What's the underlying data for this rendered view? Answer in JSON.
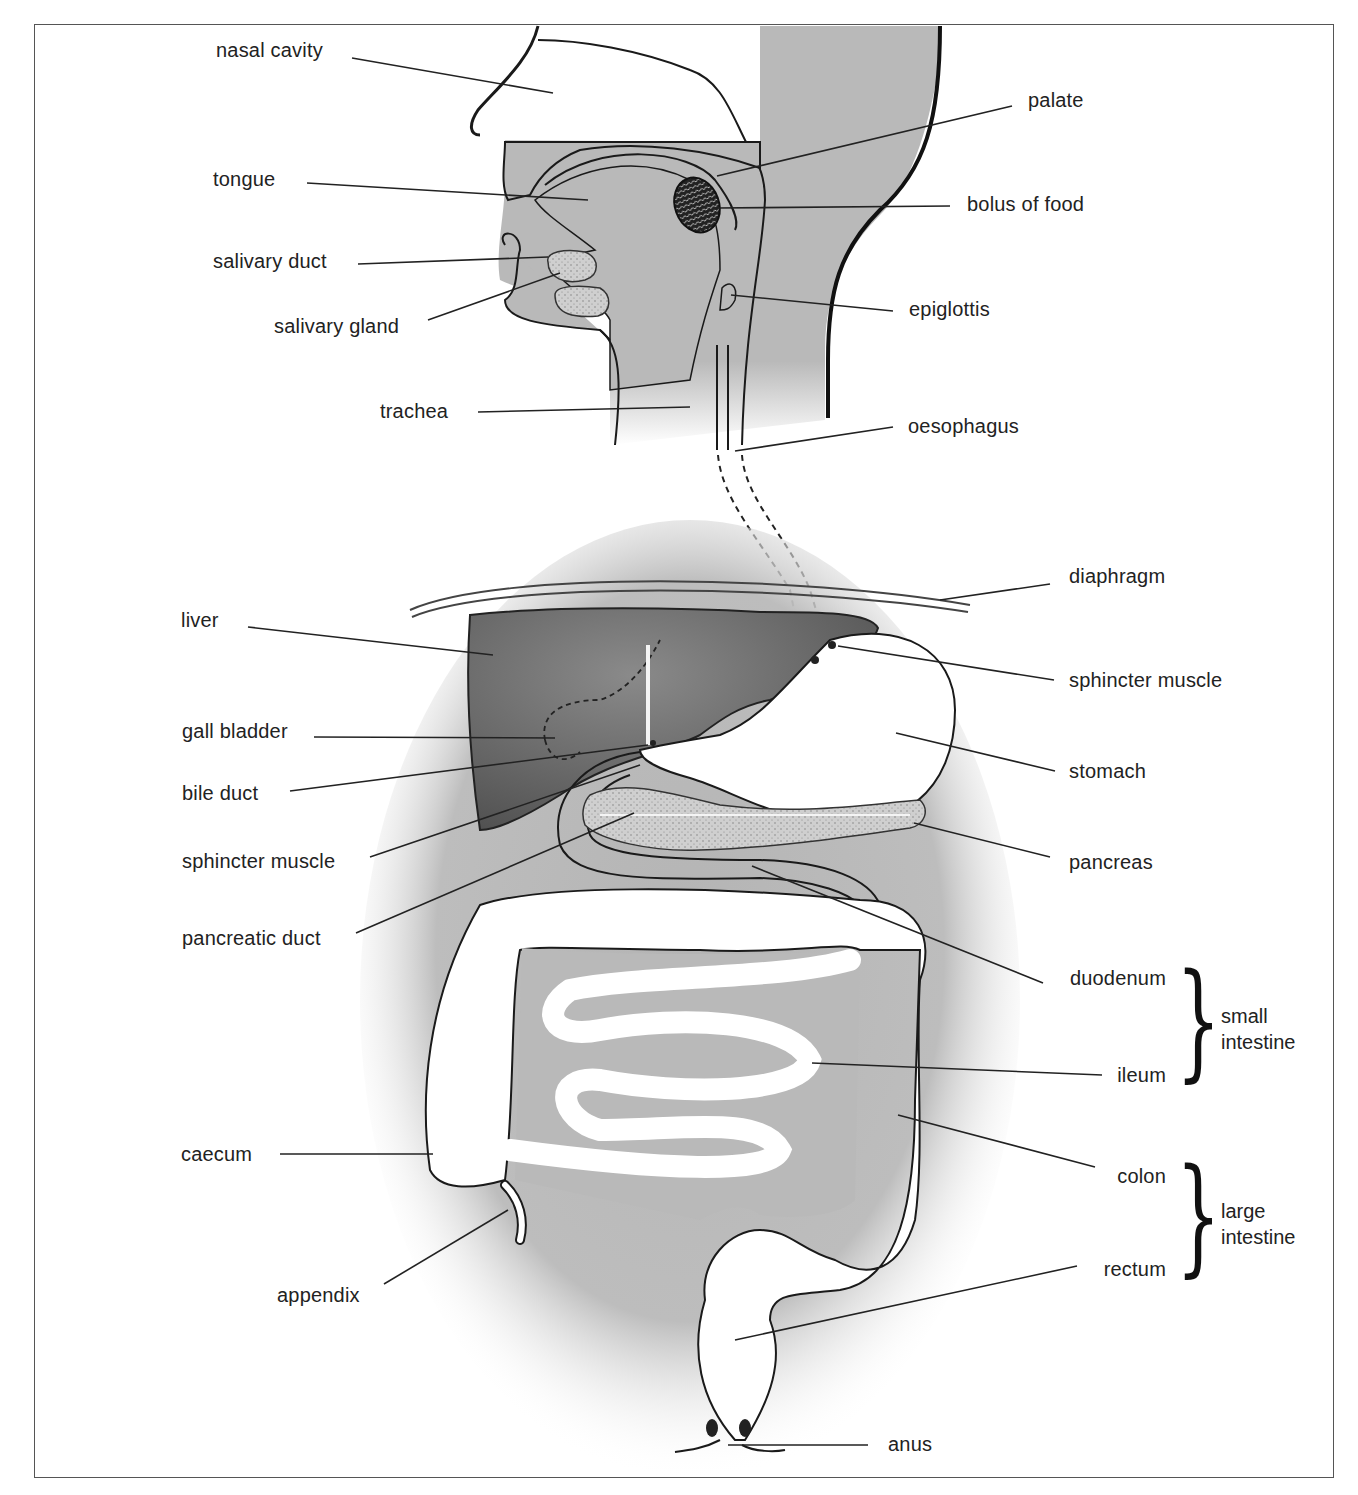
{
  "diagram": {
    "colors": {
      "tissue_gray": "#b9b9b9",
      "liver_dark": "#6f6f6f",
      "outline": "#1a1a1a",
      "background": "#ffffff"
    },
    "labels": {
      "nasal_cavity": "nasal cavity",
      "tongue": "tongue",
      "salivary_duct": "salivary duct",
      "salivary_gland": "salivary gland",
      "trachea": "trachea",
      "palate": "palate",
      "bolus_of_food": "bolus of food",
      "epiglottis": "epiglottis",
      "oesophagus": "oesophagus",
      "liver": "liver",
      "gall_bladder": "gall bladder",
      "bile_duct": "bile duct",
      "sphincter_muscle_left": "sphincter muscle",
      "pancreatic_duct": "pancreatic duct",
      "diaphragm": "diaphragm",
      "sphincter_muscle_right": "sphincter muscle",
      "stomach": "stomach",
      "pancreas": "pancreas",
      "duodenum": "duodenum",
      "ileum": "ileum",
      "colon": "colon",
      "rectum": "rectum",
      "caecum": "caecum",
      "appendix": "appendix",
      "anus": "anus"
    },
    "groups": {
      "small_intestine": "small intestine",
      "large_intestine": "large intestine"
    }
  }
}
